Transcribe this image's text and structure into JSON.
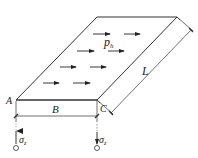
{
  "diagram": {
    "type": "strip-footing-horizontal-load",
    "labels": {
      "corner_a": "A",
      "corner_c": "C",
      "width": "B",
      "length": "L",
      "load": "p",
      "load_sub": "h",
      "stress_left": "σ",
      "stress_left_sub": "z",
      "stress_right": "σ",
      "stress_right_sub": "z"
    },
    "load_arrows": [
      {
        "x": 95,
        "y": 34
      },
      {
        "x": 125,
        "y": 34
      },
      {
        "x": 79,
        "y": 51
      },
      {
        "x": 109,
        "y": 51
      },
      {
        "x": 61,
        "y": 67
      },
      {
        "x": 91,
        "y": 67
      },
      {
        "x": 44,
        "y": 83
      },
      {
        "x": 74,
        "y": 83
      }
    ],
    "colors": {
      "line": "#333333",
      "text": "#222222"
    }
  }
}
